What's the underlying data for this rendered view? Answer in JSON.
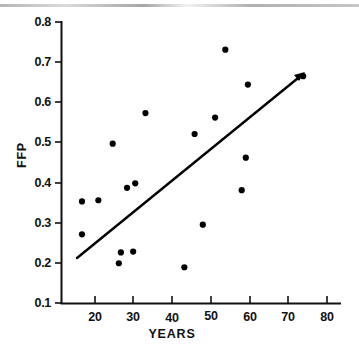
{
  "figure": {
    "background_color": "#ffffff",
    "ink_color": "#000000",
    "has_scan_artifact": true
  },
  "chart_data": {
    "type": "scatter",
    "title": "",
    "xlabel": "YEARS",
    "ylabel": "FFP",
    "xlim": [
      14,
      82
    ],
    "ylim": [
      0.1,
      0.8
    ],
    "grid": false,
    "legend": null,
    "xticks": [
      20,
      30,
      40,
      50,
      60,
      70,
      80
    ],
    "xtick_labels": [
      "20",
      "30",
      "40",
      "50",
      "60",
      "70",
      "80"
    ],
    "yticks": [
      0.1,
      0.2,
      0.3,
      0.4,
      0.5,
      0.6,
      0.7,
      0.8
    ],
    "ytick_labels": [
      "0.1",
      "0.2",
      "0.3",
      "0.4",
      "0.5",
      "0.6",
      "0.7",
      "0.8"
    ],
    "x": [
      19,
      19,
      23,
      26.5,
      28,
      28.5,
      30,
      31.5,
      32,
      34.5,
      44,
      46.5,
      48.5,
      51.5,
      54,
      54.5,
      58,
      59,
      59.5,
      73
    ],
    "y": [
      0.353,
      0.271,
      0.356,
      0.497,
      0.199,
      0.226,
      0.387,
      0.228,
      0.398,
      0.573,
      0.189,
      0.521,
      0.295,
      0.562,
      0.731,
      0.381,
      0.644,
      0.462,
      0.381,
      0.665
    ],
    "marker": "filled-circle",
    "marker_color": "#000000",
    "series": [
      {
        "name": "observations",
        "points": [
          {
            "x": 19,
            "y": 0.353
          },
          {
            "x": 19,
            "y": 0.271
          },
          {
            "x": 23,
            "y": 0.356
          },
          {
            "x": 26.5,
            "y": 0.497
          },
          {
            "x": 28,
            "y": 0.199
          },
          {
            "x": 28.5,
            "y": 0.226
          },
          {
            "x": 30,
            "y": 0.387
          },
          {
            "x": 31.5,
            "y": 0.228
          },
          {
            "x": 32,
            "y": 0.398
          },
          {
            "x": 34.5,
            "y": 0.573
          },
          {
            "x": 44,
            "y": 0.189
          },
          {
            "x": 46.5,
            "y": 0.521
          },
          {
            "x": 48.5,
            "y": 0.295
          },
          {
            "x": 51.5,
            "y": 0.562
          },
          {
            "x": 54,
            "y": 0.731
          },
          {
            "x": 58,
            "y": 0.381
          },
          {
            "x": 59,
            "y": 0.462
          },
          {
            "x": 59.5,
            "y": 0.644
          },
          {
            "x": 73,
            "y": 0.665
          }
        ]
      }
    ],
    "trend_line": {
      "name": "regression-line",
      "x_start": 18.5,
      "y_start": 0.226,
      "x_end": 73.5,
      "y_end": 0.672,
      "has_arrow_head": true
    }
  }
}
